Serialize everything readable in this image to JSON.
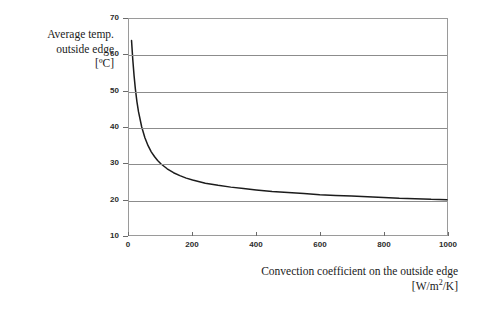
{
  "chart_data": {
    "type": "line",
    "title": "",
    "ylabel_lines": [
      "Average temp.",
      "outside edge",
      "[ºC]"
    ],
    "xlabel_lines": [
      "Convection coefficient on the outside edge",
      "[W/m²/K]"
    ],
    "xlabel_line2_prefix": "[W/m",
    "xlabel_line2_sup": "2",
    "xlabel_line2_suffix": "/K]",
    "xlabel": "Convection coefficient on the outside edge [W/m2/K]",
    "ylabel": "Average temp. outside edge [ºC]",
    "xlim": [
      0,
      1000
    ],
    "ylim": [
      10,
      70
    ],
    "xticks": [
      0,
      200,
      400,
      600,
      800,
      1000
    ],
    "yticks": [
      10,
      20,
      30,
      40,
      50,
      60,
      70
    ],
    "xtick_labels": [
      "0",
      "200",
      "400",
      "600",
      "800",
      "1000"
    ],
    "ytick_labels": [
      "10",
      "20",
      "30",
      "40",
      "50",
      "60",
      "70"
    ],
    "grid": "horizontal",
    "legend": "none",
    "line_color": "#1c1c1c",
    "grid_color": "#8c8c8c",
    "frame_color": "#9a9a9a",
    "background": "#ffffff",
    "series": [
      {
        "name": "Average temp. outside edge",
        "x": [
          8,
          12,
          16,
          20,
          25,
          30,
          40,
          50,
          60,
          70,
          80,
          90,
          100,
          120,
          140,
          160,
          180,
          200,
          240,
          280,
          320,
          360,
          400,
          450,
          500,
          550,
          600,
          650,
          700,
          750,
          800,
          850,
          900,
          950,
          1000
        ],
        "values": [
          64.0,
          58.6,
          54.2,
          50.6,
          47.0,
          44.2,
          40.0,
          37.0,
          34.8,
          33.1,
          31.8,
          30.7,
          29.8,
          28.4,
          27.3,
          26.5,
          25.8,
          25.3,
          24.4,
          23.8,
          23.3,
          22.9,
          22.5,
          22.1,
          21.8,
          21.5,
          21.2,
          21.0,
          20.8,
          20.6,
          20.4,
          20.2,
          20.1,
          19.9,
          19.8
        ]
      }
    ]
  }
}
